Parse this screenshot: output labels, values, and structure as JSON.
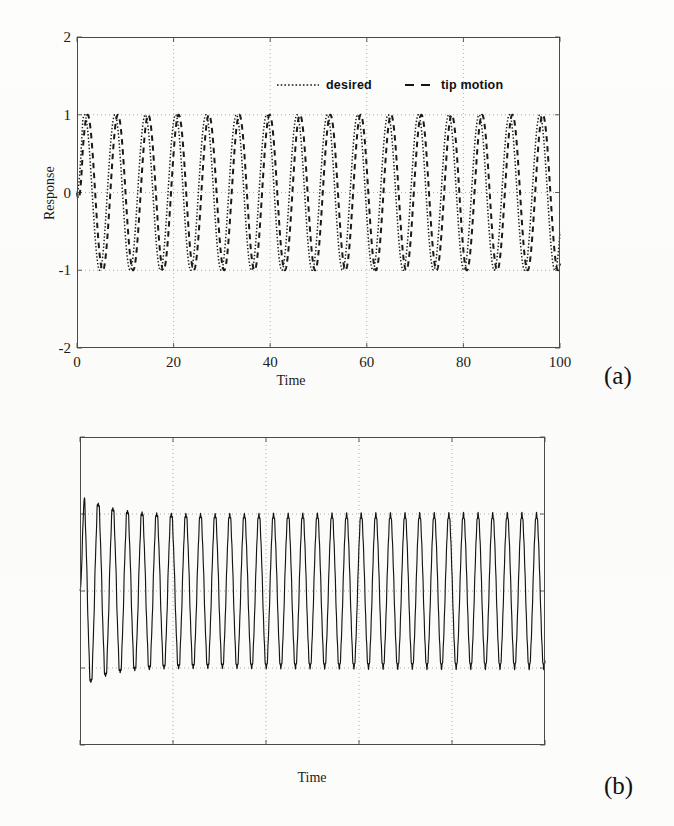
{
  "panels": [
    {
      "caption": "(a)",
      "legend": [
        {
          "label": "desired",
          "style": "dotted",
          "icon": "dotted-line-icon"
        },
        {
          "label": "tip motion",
          "style": "dashed",
          "icon": "dashed-line-icon"
        }
      ]
    },
    {
      "caption": "(b)",
      "legend": []
    }
  ],
  "chart_data": [
    {
      "type": "line",
      "title": "",
      "xlabel": "Time",
      "ylabel": "Response",
      "xlim": [
        0,
        100
      ],
      "ylim": [
        -2,
        2
      ],
      "xticks": [
        0,
        20,
        40,
        60,
        80,
        100
      ],
      "yticks": [
        -2,
        -1,
        0,
        1,
        2
      ],
      "xticklabels": [
        "0",
        "20",
        "40",
        "60",
        "80",
        "100"
      ],
      "yticklabels": [
        "-2",
        "-1",
        "0",
        "1",
        "2"
      ],
      "grid": true,
      "grid_style": "dotted",
      "legend": [
        "desired",
        "tip motion"
      ],
      "legend_position": "upper-center",
      "series": [
        {
          "name": "desired",
          "linestyle": "dotted",
          "color": "#1a1a1a",
          "description": "Sinusoidal reference, amplitude 1, angular frequency 1 rad/s, zero phase, starting at 0 and rising.",
          "amplitude": 1.0,
          "omega": 1.0,
          "phase": 0.0,
          "cycles_over_window": 15.9
        },
        {
          "name": "tip motion",
          "linestyle": "dashed",
          "color": "#1a1a1a",
          "description": "Tracked tip response lagging the reference by a small phase, amplitude 1, same frequency.",
          "amplitude": 1.0,
          "omega": 1.0,
          "phase": -0.62,
          "cycles_over_window": 15.9
        }
      ]
    },
    {
      "type": "line",
      "title": "",
      "xlabel": "Time",
      "ylabel": "Tip deformation",
      "xlim": [
        0,
        100
      ],
      "ylim": [
        -0.04,
        0.04
      ],
      "xticks": [
        0,
        20,
        40,
        60,
        80,
        100
      ],
      "yticks": [
        -0.04,
        -0.02,
        0,
        0.02,
        0.04
      ],
      "xticklabels": [
        "0",
        "20",
        "40",
        "60",
        "80",
        "100"
      ],
      "yticklabels": [
        "-0.04",
        "-0.02",
        "0",
        "0.02",
        "0.04"
      ],
      "grid": true,
      "grid_style": "dotted",
      "legend": [],
      "series": [
        {
          "name": "tip deformation",
          "linestyle": "solid",
          "color": "#151515",
          "description": "Elastic tip deformation oscillating at roughly twice the reference frequency, steady amplitude 0.02, with an initial transient reaching about 0.026 near t = 2 and a high-frequency ripple riding on the waveform.",
          "steady_amplitude": 0.02,
          "transient_peak": 0.026,
          "transient_decay_time": 6,
          "omega": 2.0,
          "cycles_over_window": 16.0
        }
      ]
    }
  ]
}
